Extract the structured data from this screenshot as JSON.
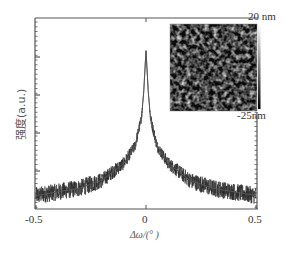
{
  "chart_data": {
    "type": "line",
    "title": "",
    "xlabel": "Δω/(°)",
    "ylabel": "强度(a.u.)",
    "xlim": [
      -0.5,
      0.5
    ],
    "ylim": [
      0,
      1
    ],
    "x_ticks": [
      "-0.5",
      "0",
      "0.5"
    ],
    "y_ticks": [],
    "grid": false,
    "legend": null,
    "series": [
      {
        "name": "XRD rocking curve",
        "description": "Sharp peak centred at Δω = 0 with noisy background",
        "x": [
          -0.5,
          -0.4,
          -0.3,
          -0.2,
          -0.1,
          -0.05,
          -0.02,
          -0.01,
          0,
          0.01,
          0.02,
          0.05,
          0.1,
          0.2,
          0.3,
          0.4,
          0.5
        ],
        "y": [
          0.07,
          0.09,
          0.11,
          0.15,
          0.24,
          0.33,
          0.48,
          0.62,
          0.83,
          0.62,
          0.48,
          0.33,
          0.24,
          0.15,
          0.11,
          0.09,
          0.07
        ],
        "color": "#333333"
      }
    ],
    "inset": {
      "type": "AFM image",
      "colorbar_max": "20 nm",
      "colorbar_min": "-25nm"
    }
  },
  "labels": {
    "x_tick_neg": "-0.5",
    "x_tick_zero": "0",
    "x_tick_pos": "0.5",
    "xlabel": "Δω/(° )",
    "ylabel": "强度(a.u.)",
    "cb_max": "20 nm",
    "cb_min": "-25nm"
  }
}
